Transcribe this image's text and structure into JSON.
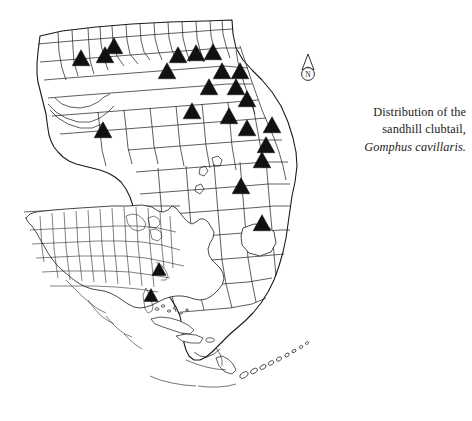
{
  "figure": {
    "title_lines": [
      "Distribution of the",
      "sandhill clubtail,"
    ],
    "species_name": "Gomphus cavillaris.",
    "background_color": "#ffffff",
    "line_color": "#1a1a1a",
    "marker_color": "#111111",
    "marker_shape": "triangle"
  },
  "north_arrow": {
    "label": "N",
    "icon": "north-arrow-icon"
  },
  "chart_data": {
    "type": "scatter",
    "title": "Distribution of the sandhill clubtail, Gomphus cavillaris.",
    "subtitle": "",
    "xlabel": "",
    "ylabel": "",
    "projection": "county-choropleth-points",
    "grid": false,
    "legend_position": "none",
    "marker_symbol": "filled-triangle",
    "marker_color": "#111111",
    "main_map": {
      "name": "Florida counties",
      "record_count": 21,
      "records": [
        {
          "id": 1,
          "x": 81,
          "y": 59,
          "region": "panhandle-west"
        },
        {
          "id": 2,
          "x": 105,
          "y": 56,
          "region": "panhandle-central"
        },
        {
          "id": 3,
          "x": 114,
          "y": 47,
          "region": "panhandle-north"
        },
        {
          "id": 4,
          "x": 103,
          "y": 131,
          "region": "panhandle-coastal"
        },
        {
          "id": 5,
          "x": 167,
          "y": 72,
          "region": "north-central-west"
        },
        {
          "id": 6,
          "x": 178,
          "y": 56,
          "region": "north-central"
        },
        {
          "id": 7,
          "x": 196,
          "y": 54,
          "region": "north-central"
        },
        {
          "id": 8,
          "x": 213,
          "y": 53,
          "region": "north-central-east"
        },
        {
          "id": 9,
          "x": 222,
          "y": 72,
          "region": "north-central-east"
        },
        {
          "id": 10,
          "x": 240,
          "y": 72,
          "region": "northeast-coast"
        },
        {
          "id": 11,
          "x": 209,
          "y": 88,
          "region": "north-central"
        },
        {
          "id": 12,
          "x": 236,
          "y": 88,
          "region": "northeast"
        },
        {
          "id": 13,
          "x": 192,
          "y": 112,
          "region": "central-north-west"
        },
        {
          "id": 14,
          "x": 229,
          "y": 117,
          "region": "central-north"
        },
        {
          "id": 15,
          "x": 247,
          "y": 100,
          "region": "northeast-coast"
        },
        {
          "id": 16,
          "x": 272,
          "y": 126,
          "region": "east-coast"
        },
        {
          "id": 17,
          "x": 266,
          "y": 146,
          "region": "east-coast"
        },
        {
          "id": 18,
          "x": 262,
          "y": 161,
          "region": "east-coast"
        },
        {
          "id": 19,
          "x": 241,
          "y": 187,
          "region": "central"
        },
        {
          "id": 20,
          "x": 262,
          "y": 224,
          "region": "central-south"
        },
        {
          "id": 21,
          "x": 247,
          "y": 129,
          "region": "east-central"
        }
      ]
    },
    "inset_map": {
      "name": "North America",
      "record_count": 2,
      "records": [
        {
          "id": 1,
          "x": 159,
          "y": 270,
          "region": "carolinas"
        },
        {
          "id": 2,
          "x": 151,
          "y": 296,
          "region": "florida"
        }
      ]
    }
  }
}
